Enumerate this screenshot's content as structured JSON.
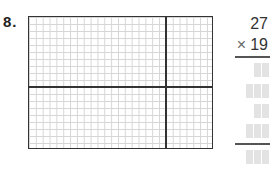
{
  "question": {
    "number": "8."
  },
  "grid": {
    "columns": 27,
    "rows": 19,
    "split_column": 20,
    "split_row": 10
  },
  "problem": {
    "multiplicand": "27",
    "operator": "×",
    "multiplier": "19",
    "answer_rows": [
      {
        "boxes": 2
      },
      {
        "boxes": 3
      },
      {
        "boxes": 2
      },
      {
        "boxes": 3
      },
      {
        "boxes": 3,
        "is_total": true
      }
    ]
  }
}
